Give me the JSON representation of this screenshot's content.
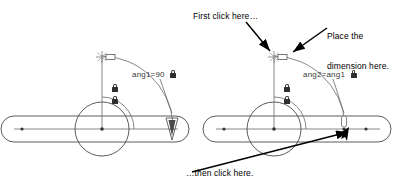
{
  "figure": {
    "background_color": "#ffffff",
    "line_color": "#4a4a4a",
    "text_color": "#000000"
  },
  "callouts": [
    {
      "id": "first-click",
      "text": "First click here…",
      "name": "callout-first-click"
    },
    {
      "id": "place-dimension",
      "line1": "Place the",
      "line2": "dimension here.",
      "name": "callout-place-dimension"
    },
    {
      "id": "then-click",
      "text": "…then click here.",
      "name": "callout-then-click"
    }
  ],
  "dimensions": [
    {
      "id": "left",
      "label": "ang1=90",
      "locked": true,
      "lock_icon": "lock-icon"
    },
    {
      "id": "right",
      "label": "ang2=ang1",
      "locked": true,
      "lock_icon": "lock-icon"
    }
  ],
  "assemblies": [
    {
      "id": "left-assembly",
      "name": "left-linkage-assembly",
      "constraint_icons": [
        "lock-icon",
        "lock-icon"
      ],
      "cursor": "dimension-placement-cursor"
    },
    {
      "id": "right-assembly",
      "name": "right-linkage-assembly",
      "constraint_icons": [
        "lock-icon",
        "lock-icon"
      ],
      "cursor": "selection-arrow-cursor"
    }
  ]
}
